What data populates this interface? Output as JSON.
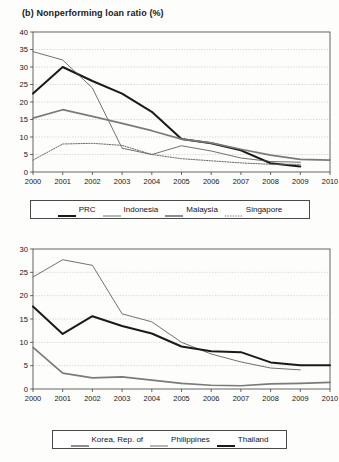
{
  "title": "(b) Nonperforming loan ratio (%)",
  "chart_data": [
    {
      "type": "line",
      "title": "(b) Nonperforming loan ratio (%)",
      "xlabel": "",
      "ylabel": "",
      "x": [
        2000,
        2001,
        2002,
        2003,
        2004,
        2005,
        2006,
        2007,
        2008,
        2009,
        2010
      ],
      "xlim": [
        2000,
        2010
      ],
      "ylim": [
        0,
        40
      ],
      "yticks": [
        0,
        5,
        10,
        15,
        20,
        25,
        30,
        35,
        40
      ],
      "xticks": [
        "2000",
        "2001",
        "2002",
        "2003",
        "2004",
        "2005",
        "2006",
        "2007",
        "2008",
        "2009",
        "2010"
      ],
      "grid": true,
      "legend_position": "below",
      "series": [
        {
          "name": "PRC",
          "style": "thick-solid",
          "color": "#1a1a1a",
          "values": [
            22.4,
            30.0,
            26.0,
            22.4,
            17.2,
            9.4,
            8.2,
            6.2,
            2.5,
            1.6,
            null
          ]
        },
        {
          "name": "Indonesia",
          "style": "thin-solid",
          "color": "#4d4d4d",
          "values": [
            34.4,
            32.0,
            24.0,
            6.8,
            5.0,
            7.5,
            6.0,
            4.0,
            3.0,
            2.8,
            null
          ]
        },
        {
          "name": "Malaysia",
          "style": "medium-solid",
          "color": "#7a7a7a",
          "values": [
            15.4,
            17.8,
            15.9,
            13.9,
            11.8,
            9.4,
            8.3,
            6.5,
            4.8,
            3.6,
            3.4
          ]
        },
        {
          "name": "Singapore",
          "style": "dotted",
          "color": "#6b6b6b",
          "values": [
            3.4,
            8.0,
            8.2,
            7.6,
            5.0,
            3.8,
            3.2,
            2.6,
            2.2,
            2.2,
            null
          ]
        }
      ]
    },
    {
      "type": "line",
      "title": "",
      "xlabel": "",
      "ylabel": "",
      "x": [
        2000,
        2001,
        2002,
        2003,
        2004,
        2005,
        2006,
        2007,
        2008,
        2009,
        2010
      ],
      "xlim": [
        2000,
        2010
      ],
      "ylim": [
        0,
        30
      ],
      "yticks": [
        0,
        5,
        10,
        15,
        20,
        25,
        30
      ],
      "xticks": [
        "2000",
        "2001",
        "2002",
        "2003",
        "2004",
        "2005",
        "2006",
        "2007",
        "2008",
        "2009",
        "2010"
      ],
      "grid": true,
      "legend_position": "below",
      "series": [
        {
          "name": "Korea, Rep. of",
          "style": "medium-solid",
          "color": "#7a7a7a",
          "values": [
            8.9,
            3.4,
            2.4,
            2.6,
            1.9,
            1.2,
            0.8,
            0.7,
            1.1,
            1.2,
            1.4
          ]
        },
        {
          "name": "Philippines",
          "style": "thin-solid",
          "color": "#4d4d4d",
          "values": [
            24.0,
            27.7,
            26.5,
            16.1,
            14.4,
            10.0,
            7.5,
            5.8,
            4.5,
            4.1,
            null
          ]
        },
        {
          "name": "Thailand",
          "style": "thick-solid",
          "color": "#1a1a1a",
          "values": [
            17.7,
            11.8,
            15.6,
            13.5,
            11.9,
            9.1,
            8.1,
            7.9,
            5.7,
            5.1,
            5.1
          ]
        }
      ]
    }
  ],
  "legend_top": {
    "items": [
      {
        "label": "PRC",
        "style": "thick-solid",
        "color": "#1a1a1a"
      },
      {
        "label": "Indonesia",
        "style": "thin-solid",
        "color": "#4d4d4d"
      },
      {
        "label": "Malaysia",
        "style": "medium-solid",
        "color": "#7a7a7a"
      },
      {
        "label": "Singapore",
        "style": "dotted",
        "color": "#6b6b6b"
      }
    ]
  },
  "legend_bottom": {
    "items": [
      {
        "label": "Korea, Rep. of",
        "style": "medium-solid",
        "color": "#7a7a7a"
      },
      {
        "label": "Philippines",
        "style": "thin-solid",
        "color": "#4d4d4d"
      },
      {
        "label": "Thailand",
        "style": "thick-solid",
        "color": "#1a1a1a"
      }
    ]
  }
}
